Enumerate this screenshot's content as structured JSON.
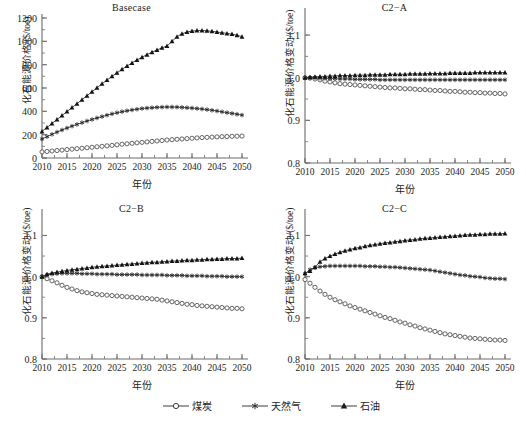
{
  "figure": {
    "xlabel": "年份",
    "ylabel_level": "化石能源价格/($/toe)",
    "ylabel_index": "化石能源价格变动/($/toe)",
    "xticks": [
      "2010",
      "2015",
      "2020",
      "2025",
      "2030",
      "2035",
      "2040",
      "2045",
      "2050"
    ],
    "yticks_level": [
      "0",
      "200",
      "400",
      "600",
      "800",
      "1000",
      "1200"
    ],
    "yticks_index": [
      "0.8",
      "0.9",
      "1.0",
      "1.1"
    ],
    "legend": [
      {
        "label": "煤炭",
        "marker": "open-circle"
      },
      {
        "label": "天然气",
        "marker": "asterisk"
      },
      {
        "label": "石油",
        "marker": "filled-triangle"
      }
    ],
    "line_color": "#3a3a3a"
  },
  "chart_data": [
    {
      "type": "line",
      "title": "Basecase",
      "xlabel": "年份",
      "ylabel": "化石能源价格/($/toe)",
      "xlim": [
        2010,
        2050
      ],
      "ylim": [
        0,
        1200
      ],
      "grid": false,
      "legend_position": "figure-bottom",
      "x": [
        2010,
        2011,
        2012,
        2013,
        2014,
        2015,
        2016,
        2017,
        2018,
        2019,
        2020,
        2021,
        2022,
        2023,
        2024,
        2025,
        2026,
        2027,
        2028,
        2029,
        2030,
        2031,
        2032,
        2033,
        2034,
        2035,
        2036,
        2037,
        2038,
        2039,
        2040,
        2041,
        2042,
        2043,
        2044,
        2045,
        2046,
        2047,
        2048,
        2049,
        2050
      ],
      "series": [
        {
          "name": "煤炭",
          "marker": "open-circle",
          "values": [
            52,
            56,
            60,
            64,
            68,
            72,
            76,
            80,
            84,
            88,
            92,
            96,
            100,
            104,
            108,
            113,
            118,
            122,
            126,
            130,
            134,
            138,
            142,
            146,
            150,
            154,
            157,
            160,
            163,
            166,
            169,
            172,
            175,
            177,
            179,
            181,
            183,
            184,
            186,
            187,
            188
          ]
        },
        {
          "name": "天然气",
          "marker": "asterisk",
          "values": [
            163,
            183,
            203,
            222,
            240,
            257,
            273,
            288,
            303,
            317,
            330,
            343,
            355,
            367,
            378,
            388,
            397,
            405,
            412,
            418,
            424,
            428,
            431,
            434,
            436,
            437,
            437,
            436,
            434,
            431,
            428,
            424,
            420,
            415,
            409,
            403,
            396,
            389,
            382,
            375,
            368
          ]
        },
        {
          "name": "石油",
          "marker": "filled-triangle",
          "values": [
            228,
            262,
            296,
            330,
            364,
            398,
            432,
            466,
            500,
            534,
            568,
            602,
            636,
            668,
            700,
            730,
            760,
            788,
            815,
            840,
            864,
            886,
            907,
            926,
            944,
            960,
            1000,
            1040,
            1065,
            1080,
            1088,
            1092,
            1093,
            1090,
            1086,
            1080,
            1074,
            1068,
            1062,
            1052,
            1040
          ]
        }
      ]
    },
    {
      "type": "line",
      "title": "C2−A",
      "xlabel": "年份",
      "ylabel": "化石能源价格变动/($/toe)",
      "xlim": [
        2010,
        2050
      ],
      "ylim": [
        0.8,
        1.14
      ],
      "grid": false,
      "legend_position": "figure-bottom",
      "x": [
        2010,
        2011,
        2012,
        2013,
        2014,
        2015,
        2016,
        2017,
        2018,
        2019,
        2020,
        2021,
        2022,
        2023,
        2024,
        2025,
        2026,
        2027,
        2028,
        2029,
        2030,
        2031,
        2032,
        2033,
        2034,
        2035,
        2036,
        2037,
        2038,
        2039,
        2040,
        2041,
        2042,
        2043,
        2044,
        2045,
        2046,
        2047,
        2048,
        2049,
        2050
      ],
      "series": [
        {
          "name": "煤炭",
          "marker": "open-circle",
          "values": [
            1.0,
            0.999,
            0.997,
            0.995,
            0.992,
            0.99,
            0.988,
            0.986,
            0.985,
            0.984,
            0.983,
            0.982,
            0.981,
            0.98,
            0.979,
            0.978,
            0.977,
            0.976,
            0.976,
            0.975,
            0.974,
            0.974,
            0.973,
            0.972,
            0.972,
            0.971,
            0.97,
            0.97,
            0.969,
            0.968,
            0.968,
            0.967,
            0.966,
            0.966,
            0.965,
            0.965,
            0.964,
            0.964,
            0.963,
            0.963,
            0.962
          ]
        },
        {
          "name": "天然气",
          "marker": "asterisk",
          "values": [
            1.0,
            1.0,
            1.0,
            0.999,
            0.999,
            0.998,
            0.998,
            0.997,
            0.997,
            0.997,
            0.996,
            0.996,
            0.996,
            0.996,
            0.996,
            0.995,
            0.995,
            0.995,
            0.995,
            0.995,
            0.995,
            0.995,
            0.995,
            0.995,
            0.995,
            0.995,
            0.995,
            0.995,
            0.995,
            0.995,
            0.995,
            0.995,
            0.995,
            0.995,
            0.995,
            0.995,
            0.995,
            0.995,
            0.995,
            0.995,
            0.995
          ]
        },
        {
          "name": "石油",
          "marker": "filled-triangle",
          "values": [
            1.0,
            1.001,
            1.002,
            1.003,
            1.003,
            1.004,
            1.004,
            1.005,
            1.005,
            1.005,
            1.006,
            1.006,
            1.006,
            1.007,
            1.007,
            1.007,
            1.007,
            1.008,
            1.008,
            1.008,
            1.008,
            1.009,
            1.009,
            1.009,
            1.009,
            1.01,
            1.01,
            1.01,
            1.01,
            1.011,
            1.011,
            1.011,
            1.011,
            1.011,
            1.012,
            1.012,
            1.012,
            1.012,
            1.012,
            1.012,
            1.012
          ]
        }
      ]
    },
    {
      "type": "line",
      "title": "C2−B",
      "xlabel": "年份",
      "ylabel": "化石能源价格变动/($/toe)",
      "xlim": [
        2010,
        2050
      ],
      "ylim": [
        0.8,
        1.14
      ],
      "grid": false,
      "legend_position": "figure-bottom",
      "x": [
        2010,
        2011,
        2012,
        2013,
        2014,
        2015,
        2016,
        2017,
        2018,
        2019,
        2020,
        2021,
        2022,
        2023,
        2024,
        2025,
        2026,
        2027,
        2028,
        2029,
        2030,
        2031,
        2032,
        2033,
        2034,
        2035,
        2036,
        2037,
        2038,
        2039,
        2040,
        2041,
        2042,
        2043,
        2044,
        2045,
        2046,
        2047,
        2048,
        2049,
        2050
      ],
      "series": [
        {
          "name": "煤炭",
          "marker": "open-circle",
          "values": [
            1.0,
            0.995,
            0.99,
            0.985,
            0.979,
            0.974,
            0.97,
            0.966,
            0.963,
            0.961,
            0.959,
            0.957,
            0.956,
            0.955,
            0.954,
            0.953,
            0.952,
            0.951,
            0.95,
            0.949,
            0.948,
            0.947,
            0.946,
            0.945,
            0.943,
            0.941,
            0.939,
            0.937,
            0.935,
            0.933,
            0.932,
            0.93,
            0.929,
            0.928,
            0.927,
            0.926,
            0.925,
            0.924,
            0.923,
            0.923,
            0.922
          ]
        },
        {
          "name": "天然气",
          "marker": "asterisk",
          "values": [
            1.0,
            1.004,
            1.006,
            1.007,
            1.008,
            1.008,
            1.008,
            1.008,
            1.007,
            1.007,
            1.007,
            1.006,
            1.006,
            1.006,
            1.006,
            1.005,
            1.005,
            1.005,
            1.005,
            1.005,
            1.004,
            1.004,
            1.004,
            1.004,
            1.004,
            1.003,
            1.003,
            1.003,
            1.003,
            1.002,
            1.002,
            1.002,
            1.002,
            1.001,
            1.001,
            1.001,
            1.001,
            1.0,
            1.0,
            1.0,
            1.0
          ]
        },
        {
          "name": "石油",
          "marker": "filled-triangle",
          "values": [
            1.0,
            1.006,
            1.009,
            1.011,
            1.013,
            1.015,
            1.017,
            1.018,
            1.02,
            1.021,
            1.023,
            1.024,
            1.025,
            1.026,
            1.027,
            1.028,
            1.029,
            1.03,
            1.031,
            1.032,
            1.033,
            1.034,
            1.035,
            1.035,
            1.036,
            1.037,
            1.038,
            1.038,
            1.039,
            1.04,
            1.04,
            1.041,
            1.041,
            1.042,
            1.042,
            1.043,
            1.043,
            1.044,
            1.044,
            1.044,
            1.045
          ]
        }
      ]
    },
    {
      "type": "line",
      "title": "C2−C",
      "xlabel": "年份",
      "ylabel": "化石能源价格变动/($/toe)",
      "xlim": [
        2010,
        2050
      ],
      "ylim": [
        0.8,
        1.14
      ],
      "grid": false,
      "legend_position": "figure-bottom",
      "x": [
        2010,
        2011,
        2012,
        2013,
        2014,
        2015,
        2016,
        2017,
        2018,
        2019,
        2020,
        2021,
        2022,
        2023,
        2024,
        2025,
        2026,
        2027,
        2028,
        2029,
        2030,
        2031,
        2032,
        2033,
        2034,
        2035,
        2036,
        2037,
        2038,
        2039,
        2040,
        2041,
        2042,
        2043,
        2044,
        2045,
        2046,
        2047,
        2048,
        2049,
        2050
      ],
      "series": [
        {
          "name": "煤炭",
          "marker": "open-circle",
          "values": [
            0.993,
            0.984,
            0.974,
            0.965,
            0.957,
            0.95,
            0.944,
            0.939,
            0.934,
            0.929,
            0.925,
            0.921,
            0.917,
            0.913,
            0.909,
            0.905,
            0.901,
            0.898,
            0.894,
            0.89,
            0.887,
            0.883,
            0.88,
            0.876,
            0.873,
            0.87,
            0.867,
            0.864,
            0.861,
            0.859,
            0.857,
            0.855,
            0.853,
            0.851,
            0.85,
            0.849,
            0.848,
            0.847,
            0.846,
            0.846,
            0.845
          ]
        },
        {
          "name": "天然气",
          "marker": "asterisk",
          "values": [
            1.007,
            1.017,
            1.022,
            1.024,
            1.025,
            1.026,
            1.026,
            1.026,
            1.026,
            1.026,
            1.026,
            1.026,
            1.025,
            1.025,
            1.025,
            1.024,
            1.024,
            1.023,
            1.023,
            1.022,
            1.021,
            1.02,
            1.019,
            1.018,
            1.017,
            1.016,
            1.014,
            1.012,
            1.01,
            1.008,
            1.006,
            1.004,
            1.003,
            1.001,
            1.0,
            0.999,
            0.997,
            0.996,
            0.995,
            0.995,
            0.994
          ]
        },
        {
          "name": "石油",
          "marker": "filled-triangle",
          "values": [
            1.008,
            1.014,
            1.023,
            1.036,
            1.044,
            1.05,
            1.055,
            1.059,
            1.063,
            1.066,
            1.069,
            1.071,
            1.074,
            1.076,
            1.078,
            1.08,
            1.082,
            1.083,
            1.085,
            1.086,
            1.088,
            1.089,
            1.09,
            1.092,
            1.093,
            1.094,
            1.095,
            1.096,
            1.097,
            1.098,
            1.099,
            1.1,
            1.101,
            1.102,
            1.102,
            1.103,
            1.103,
            1.104,
            1.104,
            1.104,
            1.105
          ]
        }
      ]
    }
  ]
}
